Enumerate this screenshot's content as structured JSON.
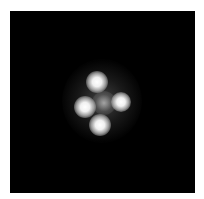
{
  "image": {
    "description": "Grayscale astronomical image of a quadruply lensed point source (four bright spots in a cross pattern around a faint central glow) on black background",
    "background_color": "#000000",
    "border_color": "#ffffff",
    "spots": [
      {
        "name": "top",
        "x": 97,
        "y": 82
      },
      {
        "name": "left",
        "x": 85,
        "y": 107
      },
      {
        "name": "right",
        "x": 122,
        "y": 103
      },
      {
        "name": "bottom",
        "x": 100,
        "y": 125
      }
    ],
    "center_glow": {
      "x": 104,
      "y": 104
    }
  }
}
